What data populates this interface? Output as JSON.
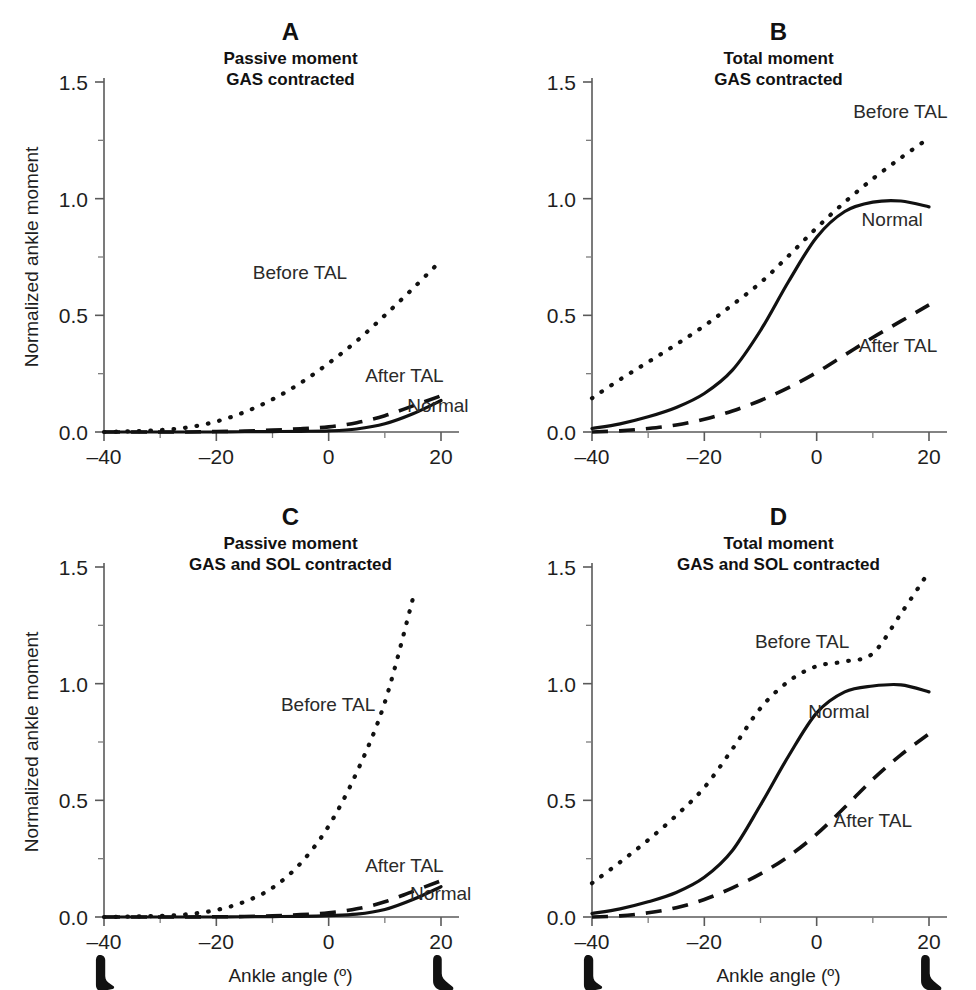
{
  "figure": {
    "background": "#ffffff",
    "ink_color": "#111111",
    "axis_color": "#5a5a5a"
  },
  "axes_common": {
    "xlabel": "Ankle angle (º)",
    "ylabel": "Normalized ankle moment",
    "xlim": [
      -40,
      20
    ],
    "ylim": [
      0.0,
      1.5
    ],
    "x_ticks_major": [
      -40,
      -20,
      0,
      20
    ],
    "x_tick_labels": [
      "–40",
      "–20",
      "0",
      "20"
    ],
    "x_ticks_minor": [
      -30,
      -10,
      10
    ],
    "y_ticks_major": [
      0.0,
      0.5,
      1.0,
      1.5
    ],
    "y_tick_labels": [
      "0.0",
      "0.5",
      "1.0",
      "1.5"
    ],
    "y_ticks_minor": [
      0.25,
      0.75,
      1.25
    ],
    "grid": false,
    "legend_position": "inline-annotations"
  },
  "foot_icons": {
    "left": {
      "name": "foot-plantarflexed-icon",
      "at_angle": -40,
      "path": "M 22 0 C 27 0 31 3 31 8 L 31 34 C 31 40 34 44 40 47 L 44 50 C 46 51 46 54 43 55 L 26 58 C 20 59 16 55 16 48 L 16 10 C 16 4 18 0 22 0 Z"
    },
    "right": {
      "name": "foot-dorsiflexed-icon",
      "at_angle": 20,
      "path": "M 18 0 C 23 -1 27 2 27 7 L 27 30 C 27 36 31 41 38 46 L 44 51 C 47 53 46 57 42 57 L 28 57 C 20 57 13 51 13 42 L 13 10 C 13 4 14 1 18 0 Z"
    }
  },
  "chart_data": [
    {
      "id": "A",
      "type": "line",
      "panel_letter": "A",
      "title_line1": "Passive moment",
      "title_line2": "GAS contracted",
      "xlabel": "",
      "ylabel": "Normalized ankle moment",
      "xlim": [
        -40,
        20
      ],
      "ylim": [
        0.0,
        1.5
      ],
      "show_ylabel": true,
      "show_xlabel": false,
      "show_feet": false,
      "x": [
        -40,
        -35,
        -30,
        -25,
        -20,
        -15,
        -10,
        -5,
        0,
        5,
        10,
        15,
        20
      ],
      "series": [
        {
          "name": "Before TAL",
          "style": "dotted",
          "label": "Before TAL",
          "label_at": {
            "x": -13.5,
            "y": 0.655
          },
          "values": [
            0.0,
            0.003,
            0.008,
            0.02,
            0.045,
            0.085,
            0.14,
            0.21,
            0.295,
            0.39,
            0.5,
            0.615,
            0.735
          ]
        },
        {
          "name": "After TAL",
          "style": "dashed",
          "label": "After TAL",
          "label_at": {
            "x": 6.5,
            "y": 0.215
          },
          "values": [
            0.0,
            0.0,
            0.0,
            0.0,
            0.002,
            0.004,
            0.008,
            0.014,
            0.022,
            0.04,
            0.07,
            0.112,
            0.155
          ]
        },
        {
          "name": "Normal",
          "style": "solid",
          "label": "Normal",
          "label_at": {
            "x": 14.0,
            "y": 0.085
          },
          "values": [
            0.0,
            0.0,
            0.0,
            0.0,
            0.0,
            0.001,
            0.002,
            0.003,
            0.005,
            0.013,
            0.035,
            0.078,
            0.135
          ]
        }
      ]
    },
    {
      "id": "B",
      "type": "line",
      "panel_letter": "B",
      "title_line1": "Total moment",
      "title_line2": "GAS contracted",
      "xlabel": "",
      "ylabel": "",
      "xlim": [
        -40,
        20
      ],
      "ylim": [
        0.0,
        1.5
      ],
      "show_ylabel": false,
      "show_xlabel": false,
      "show_feet": false,
      "x": [
        -40,
        -35,
        -30,
        -25,
        -20,
        -15,
        -10,
        -5,
        0,
        5,
        10,
        15,
        20
      ],
      "series": [
        {
          "name": "Before TAL",
          "style": "dotted",
          "label": "Before TAL",
          "label_at": {
            "x": 6.5,
            "y": 1.345
          },
          "values": [
            0.145,
            0.225,
            0.3,
            0.375,
            0.455,
            0.545,
            0.64,
            0.755,
            0.875,
            0.985,
            1.085,
            1.175,
            1.26
          ]
        },
        {
          "name": "Normal",
          "style": "solid",
          "label": "Normal",
          "label_at": {
            "x": 8.0,
            "y": 0.885
          },
          "values": [
            0.015,
            0.035,
            0.065,
            0.105,
            0.165,
            0.265,
            0.435,
            0.645,
            0.835,
            0.945,
            0.985,
            0.99,
            0.965
          ]
        },
        {
          "name": "After TAL",
          "style": "dashed",
          "label": "After TAL",
          "label_at": {
            "x": 7.5,
            "y": 0.345
          },
          "values": [
            0.0,
            0.005,
            0.015,
            0.03,
            0.055,
            0.09,
            0.135,
            0.19,
            0.255,
            0.33,
            0.405,
            0.475,
            0.545
          ]
        }
      ]
    },
    {
      "id": "C",
      "type": "line",
      "panel_letter": "C",
      "title_line1": "Passive moment",
      "title_line2": "GAS and SOL contracted",
      "xlabel": "Ankle angle (º)",
      "ylabel": "Normalized ankle moment",
      "xlim": [
        -40,
        20
      ],
      "ylim": [
        0.0,
        1.5
      ],
      "show_ylabel": true,
      "show_xlabel": true,
      "show_feet": true,
      "x": [
        -40,
        -35,
        -30,
        -25,
        -20,
        -15,
        -10,
        -5,
        0,
        5,
        10,
        15,
        20
      ],
      "series": [
        {
          "name": "Before TAL",
          "style": "dotted",
          "label": "Before TAL",
          "label_at": {
            "x": -8.5,
            "y": 0.885
          },
          "values": [
            0.0,
            0.002,
            0.005,
            0.012,
            0.03,
            0.065,
            0.125,
            0.23,
            0.39,
            0.62,
            0.92,
            1.365,
            null
          ]
        },
        {
          "name": "After TAL",
          "style": "dashed",
          "label": "After TAL",
          "label_at": {
            "x": 6.5,
            "y": 0.195
          },
          "values": [
            0.0,
            0.0,
            0.0,
            0.0,
            0.001,
            0.002,
            0.005,
            0.01,
            0.018,
            0.035,
            0.065,
            0.11,
            0.155
          ]
        },
        {
          "name": "Normal",
          "style": "solid",
          "label": "Normal",
          "label_at": {
            "x": 14.5,
            "y": 0.075
          },
          "values": [
            0.0,
            0.0,
            0.0,
            0.0,
            0.0,
            0.001,
            0.002,
            0.003,
            0.006,
            0.012,
            0.032,
            0.075,
            0.13
          ]
        }
      ]
    },
    {
      "id": "D",
      "type": "line",
      "panel_letter": "D",
      "title_line1": "Total moment",
      "title_line2": "GAS and SOL contracted",
      "xlabel": "Ankle angle (º)",
      "ylabel": "",
      "xlim": [
        -40,
        20
      ],
      "ylim": [
        0.0,
        1.5
      ],
      "show_ylabel": false,
      "show_xlabel": true,
      "show_feet": true,
      "x": [
        -40,
        -35,
        -30,
        -25,
        -20,
        -15,
        -10,
        -5,
        0,
        5,
        10,
        15,
        20
      ],
      "series": [
        {
          "name": "Before TAL",
          "style": "dotted",
          "label": "Before TAL",
          "label_at": {
            "x": -11.0,
            "y": 1.155
          },
          "values": [
            0.145,
            0.235,
            0.33,
            0.435,
            0.555,
            0.72,
            0.895,
            1.01,
            1.075,
            1.095,
            1.13,
            1.3,
            1.48
          ]
        },
        {
          "name": "Normal",
          "style": "solid",
          "label": "Normal",
          "label_at": {
            "x": -1.5,
            "y": 0.855
          },
          "values": [
            0.015,
            0.035,
            0.065,
            0.105,
            0.17,
            0.285,
            0.48,
            0.69,
            0.875,
            0.965,
            0.99,
            0.995,
            0.965
          ]
        },
        {
          "name": "After TAL",
          "style": "dashed",
          "label": "After TAL",
          "label_at": {
            "x": 3.0,
            "y": 0.385
          },
          "values": [
            0.0,
            0.005,
            0.018,
            0.04,
            0.075,
            0.125,
            0.185,
            0.26,
            0.355,
            0.47,
            0.59,
            0.695,
            0.785
          ]
        }
      ]
    }
  ]
}
